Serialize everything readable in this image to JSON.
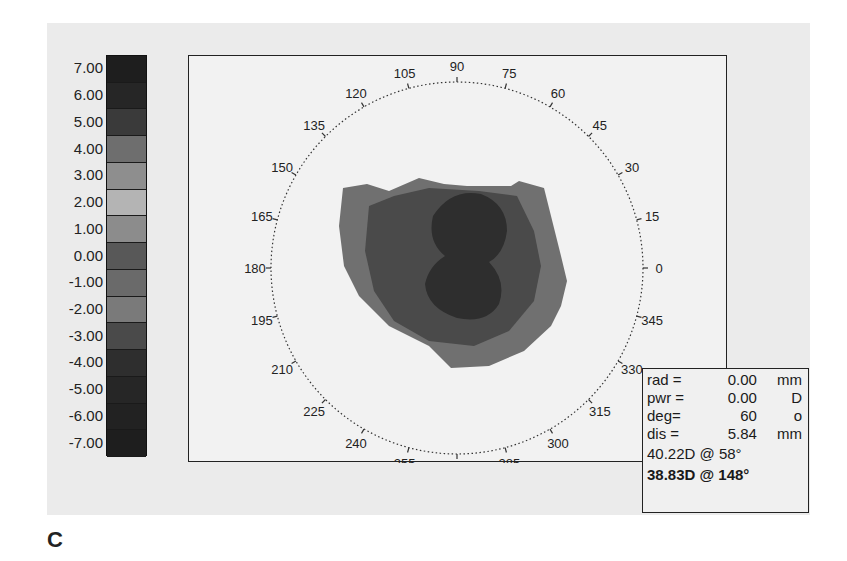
{
  "figure_label": "C",
  "colors": {
    "panel_bg": "#ebebeb",
    "plot_bg": "#f2f2f2",
    "frame": "#222222",
    "contour_outer": "#707070",
    "contour_mid": "#4a4a4a",
    "contour_inner": "#2e2e2e"
  },
  "color_scale": {
    "unit": "D",
    "labels": [
      "7.00",
      "6.00",
      "5.00",
      "4.00",
      "3.00",
      "2.00",
      "1.00",
      "0.00",
      "-1.00",
      "-2.00",
      "-3.00",
      "-4.00",
      "-5.00",
      "-6.00",
      "-7.00"
    ],
    "swatches": [
      "#1e1e1e",
      "#262626",
      "#3a3a3a",
      "#6e6e6e",
      "#8e8e8e",
      "#b4b4b4",
      "#8c8c8c",
      "#585858",
      "#6a6a6a",
      "#7a7a7a",
      "#4a4a4a",
      "#2e2e2e",
      "#262626",
      "#222222",
      "#1e1e1e"
    ]
  },
  "polar_axis": {
    "angle_labels": [
      "0",
      "15",
      "30",
      "45",
      "60",
      "75",
      "90",
      "105",
      "120",
      "135",
      "150",
      "165",
      "180",
      "195",
      "210",
      "225",
      "240",
      "255",
      "270",
      "285",
      "300",
      "315",
      "330",
      "345"
    ]
  },
  "info_box": {
    "rows": [
      {
        "key": "rad =",
        "value": "0.00",
        "unit": "mm"
      },
      {
        "key": "pwr =",
        "value": "0.00",
        "unit": "D"
      },
      {
        "key": "deg=",
        "value": "60",
        "unit": "o"
      },
      {
        "key": "dis =",
        "value": "5.84",
        "unit": "mm"
      }
    ],
    "k1": "40.22D @  58°",
    "k2": "38.83D @ 148°"
  },
  "chart_data": {
    "type": "heatmap",
    "title": "",
    "subtitle": "Corneal topography map (polar)",
    "xlabel": "",
    "ylabel": "",
    "color_scale": {
      "min": -7.0,
      "max": 7.0,
      "step": 1.0,
      "ticks": [
        7.0,
        6.0,
        5.0,
        4.0,
        3.0,
        2.0,
        1.0,
        0.0,
        -1.0,
        -2.0,
        -3.0,
        -4.0,
        -5.0,
        -6.0,
        -7.0
      ],
      "unit": "D"
    },
    "polar_angles_deg": [
      0,
      15,
      30,
      45,
      60,
      75,
      90,
      105,
      120,
      135,
      150,
      165,
      180,
      195,
      210,
      225,
      240,
      255,
      270,
      285,
      300,
      315,
      330,
      345
    ],
    "regions": [
      {
        "name": "outer zone",
        "approx_value": "-1.00 to -2.00",
        "shade": "medium gray"
      },
      {
        "name": "middle zone",
        "approx_value": "-3.00 to -4.00",
        "shade": "dark gray"
      },
      {
        "name": "central zone",
        "approx_value": "-5.00 to -6.00",
        "shade": "darkest gray, peanut shape slightly right of center"
      }
    ],
    "readout": {
      "rad_mm": 0.0,
      "pwr_D": 0.0,
      "deg": 60,
      "dis_mm": 5.84,
      "k_steep": {
        "power_D": 40.22,
        "axis_deg": 58
      },
      "k_flat": {
        "power_D": 38.83,
        "axis_deg": 148
      }
    },
    "grid": false,
    "legend_position": "left color bar"
  }
}
